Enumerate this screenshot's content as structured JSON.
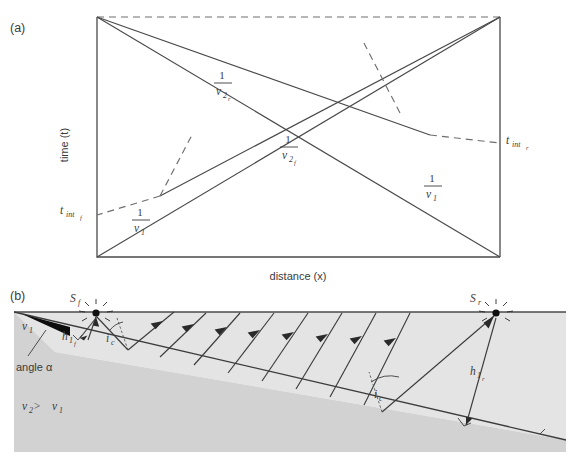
{
  "figure": {
    "panel_a": {
      "tag": "(a)",
      "xlabel": "distance (x)",
      "ylabel": "time (t)",
      "labels": {
        "slope_reverse_v2": {
          "numerator": "1",
          "denominator": "v",
          "sub": "2",
          "subsub": "r"
        },
        "slope_forward_v2": {
          "numerator": "1",
          "denominator": "v",
          "sub": "2",
          "subsub": "f"
        },
        "slope_forward_v1": {
          "numerator": "1",
          "denominator": "v",
          "sub": "1",
          "subsub": ""
        },
        "slope_reverse_v1": {
          "numerator": "1",
          "denominator": "v",
          "sub": "1",
          "subsub": ""
        },
        "intercept_forward": {
          "base": "t",
          "sub": "int",
          "subsub": "f"
        },
        "intercept_reverse": {
          "base": "t",
          "sub": "int",
          "subsub": "r"
        }
      }
    },
    "panel_b": {
      "tag": "(b)",
      "source_forward": {
        "base": "S",
        "sub": "f"
      },
      "source_reverse": {
        "base": "S",
        "sub": "r"
      },
      "depth_forward": {
        "base": "h",
        "sub": "1",
        "subsub": "f"
      },
      "depth_reverse": {
        "base": "h",
        "sub": "1",
        "subsub": "r"
      },
      "critical_angle_left": {
        "base": "i",
        "sub": "c"
      },
      "critical_angle_right": {
        "base": "i",
        "sub": "c"
      },
      "velocity_upper": {
        "base": "v",
        "sub": "1"
      },
      "velocity_relation": {
        "base1": "v",
        "sub1": "2",
        "relation": " > ",
        "base2": "v",
        "sub2": "1"
      },
      "dip_label": "angle α"
    },
    "colors": {
      "line": "#4a4a4a",
      "dash": "#6e6e6e",
      "upper_layer": "#e4e4e4",
      "lower_layer": "#d2d2d2",
      "text": "#3b3b3b",
      "source_dot": "#101010"
    }
  }
}
